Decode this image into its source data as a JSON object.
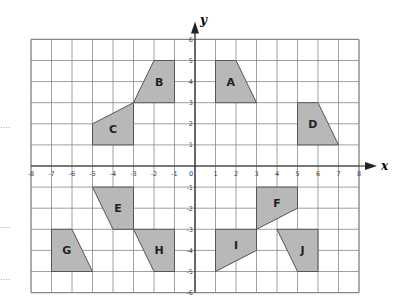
{
  "diagram": {
    "axes": {
      "x_label": "x",
      "y_label": "y",
      "x_min": -8,
      "x_max": 8,
      "y_min": -6,
      "y_max": 6,
      "x_ticks": [
        "-8",
        "-7",
        "-6",
        "-5",
        "-4",
        "-3",
        "-2",
        "-1",
        "0",
        "1",
        "2",
        "3",
        "4",
        "5",
        "6",
        "7",
        "8"
      ],
      "y_ticks": [
        "6",
        "5",
        "4",
        "3",
        "2",
        "1",
        "-1",
        "-2",
        "-3",
        "-4",
        "-5",
        "-6"
      ]
    },
    "colors": {
      "shape_fill": "#b8b8b8",
      "shape_stroke": "#555555",
      "grid": "#888888",
      "axis": "#222222"
    },
    "shapes": [
      {
        "label": "A",
        "points": [
          [
            1,
            5
          ],
          [
            2,
            5
          ],
          [
            3,
            3
          ],
          [
            1,
            3
          ]
        ]
      },
      {
        "label": "B",
        "points": [
          [
            -2,
            5
          ],
          [
            -1,
            5
          ],
          [
            -1,
            3
          ],
          [
            -3,
            3
          ]
        ]
      },
      {
        "label": "C",
        "points": [
          [
            -5,
            2
          ],
          [
            -3,
            3
          ],
          [
            -3,
            1
          ],
          [
            -5,
            1
          ]
        ]
      },
      {
        "label": "D",
        "points": [
          [
            5,
            3
          ],
          [
            6,
            3
          ],
          [
            7,
            1
          ],
          [
            5,
            1
          ]
        ]
      },
      {
        "label": "E",
        "points": [
          [
            -5,
            -1
          ],
          [
            -3,
            -1
          ],
          [
            -3,
            -3
          ],
          [
            -4,
            -3
          ]
        ]
      },
      {
        "label": "F",
        "points": [
          [
            3,
            -1
          ],
          [
            5,
            -1
          ],
          [
            5,
            -2
          ],
          [
            3,
            -3
          ]
        ]
      },
      {
        "label": "G",
        "points": [
          [
            -7,
            -3
          ],
          [
            -6,
            -3
          ],
          [
            -5,
            -5
          ],
          [
            -7,
            -5
          ]
        ]
      },
      {
        "label": "H",
        "points": [
          [
            -3,
            -3
          ],
          [
            -1,
            -3
          ],
          [
            -1,
            -5
          ],
          [
            -2,
            -5
          ]
        ]
      },
      {
        "label": "I",
        "points": [
          [
            1,
            -3
          ],
          [
            3,
            -3
          ],
          [
            3,
            -4
          ],
          [
            1,
            -5
          ]
        ]
      },
      {
        "label": "J",
        "points": [
          [
            4,
            -3
          ],
          [
            6,
            -3
          ],
          [
            6,
            -5
          ],
          [
            5,
            -5
          ]
        ]
      }
    ],
    "margin_marks": [
      "....",
      "....",
      "...."
    ]
  }
}
